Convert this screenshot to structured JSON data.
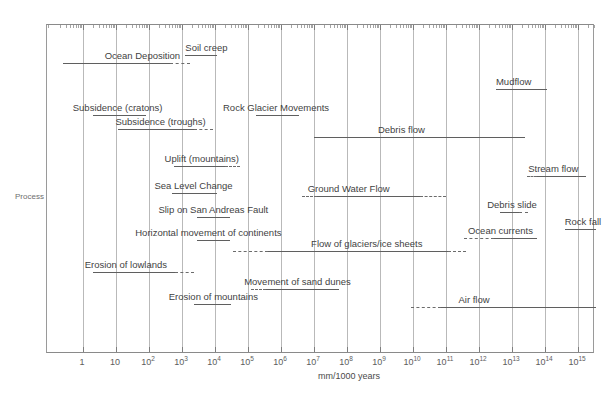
{
  "chart_data": {
    "type": "bar",
    "title": "",
    "xlabel": "mm/1000 years",
    "ylabel": "Process",
    "scale": "log10",
    "xlim": [
      -1.1,
      15.6
    ],
    "grid": true,
    "legend": "none",
    "xtick_labels": [
      "1",
      "10",
      "10²",
      "10³",
      "10⁴",
      "10⁵",
      "10⁶",
      "10⁷",
      "10⁸",
      "10⁹",
      "10¹⁰",
      "10¹¹",
      "10¹²",
      "10¹³",
      "10¹⁴",
      "10¹⁵"
    ],
    "xtick_exponents": [
      0,
      1,
      2,
      3,
      4,
      5,
      6,
      7,
      8,
      9,
      10,
      11,
      12,
      13,
      14,
      15
    ],
    "note": "Horizontal ranges of rates of geomorphic processes on a log10 axis of mm per 1000 years. Dashed segments denote uncertain / extrapolated extents of each range.",
    "series": [
      {
        "name": "Soil creep",
        "label": "Soil creep",
        "label_align": "left",
        "label_at": 3.1,
        "row_y": 54,
        "segments": [
          {
            "from": 3.1,
            "to": 4.05,
            "style": "solid"
          }
        ]
      },
      {
        "name": "Ocean Deposition",
        "label": "Ocean Deposition",
        "label_align": "center",
        "label_at": 1.8,
        "row_y": 62,
        "segments": [
          {
            "from": -0.6,
            "to": 2.65,
            "style": "solid"
          },
          {
            "from": 2.65,
            "to": 3.25,
            "style": "dashed"
          }
        ]
      },
      {
        "name": "Mudflow",
        "label": "Mudflow",
        "label_align": "center",
        "label_at": 13.05,
        "row_y": 88,
        "segments": [
          {
            "from": 12.5,
            "to": 14.05,
            "style": "solid"
          }
        ]
      },
      {
        "name": "Subsidence (cratons)",
        "label": "Subsidence (cratons)",
        "label_align": "center",
        "label_at": 1.05,
        "row_y": 114,
        "segments": [
          {
            "from": 0.3,
            "to": 1.9,
            "style": "solid"
          }
        ]
      },
      {
        "name": "Rock Glacier Movements",
        "label": "Rock Glacier Movements",
        "label_align": "center",
        "label_at": 5.85,
        "row_y": 114,
        "segments": [
          {
            "from": 5.25,
            "to": 6.55,
            "style": "solid"
          }
        ]
      },
      {
        "name": "Subsidence (troughs)",
        "label": "Subsidence (troughs)",
        "label_align": "center",
        "label_at": 2.35,
        "row_y": 128,
        "segments": [
          {
            "from": 1.05,
            "to": 3.35,
            "style": "solid"
          },
          {
            "from": 3.35,
            "to": 3.95,
            "style": "dashed"
          }
        ]
      },
      {
        "name": "Debris flow",
        "label": "Debris flow",
        "label_align": "center",
        "label_at": 9.65,
        "row_y": 136,
        "segments": [
          {
            "from": 7.0,
            "to": 13.4,
            "style": "solid"
          }
        ]
      },
      {
        "name": "Uplift (mountains)",
        "label": "Uplift (mountains)",
        "label_align": "center",
        "label_at": 3.6,
        "row_y": 165,
        "segments": [
          {
            "from": 2.75,
            "to": 4.3,
            "style": "solid"
          },
          {
            "from": 4.3,
            "to": 4.75,
            "style": "dashed"
          }
        ]
      },
      {
        "name": "Stream flow",
        "label": "Stream flow",
        "label_align": "center",
        "label_at": 14.25,
        "row_y": 175,
        "segments": [
          {
            "from": 13.45,
            "to": 13.75,
            "style": "dashed"
          },
          {
            "from": 13.75,
            "to": 15.25,
            "style": "solid"
          }
        ]
      },
      {
        "name": "Sea Level Change",
        "label": "Sea Level Change",
        "label_align": "center",
        "label_at": 3.35,
        "row_y": 192,
        "segments": [
          {
            "from": 2.7,
            "to": 4.05,
            "style": "solid"
          }
        ]
      },
      {
        "name": "Ground Water Flow",
        "label": "Ground Water Flow",
        "label_align": "center",
        "label_at": 8.05,
        "row_y": 195,
        "segments": [
          {
            "from": 6.65,
            "to": 7.1,
            "style": "dashed"
          },
          {
            "from": 7.1,
            "to": 10.2,
            "style": "solid"
          },
          {
            "from": 10.2,
            "to": 11.0,
            "style": "dashed"
          }
        ]
      },
      {
        "name": "Debris slide",
        "label": "Debris slide",
        "label_align": "center",
        "label_at": 13.0,
        "row_y": 211,
        "segments": [
          {
            "from": 12.65,
            "to": 13.2,
            "style": "solid"
          },
          {
            "from": 13.2,
            "to": 13.5,
            "style": "dashed"
          }
        ]
      },
      {
        "name": "Slip on San Andreas Fault",
        "label": "Slip on San Andreas Fault",
        "label_align": "center",
        "label_at": 3.95,
        "row_y": 216,
        "segments": [
          {
            "from": 3.45,
            "to": 4.45,
            "style": "solid"
          }
        ]
      },
      {
        "name": "Rock fall",
        "label": "Rock fall",
        "label_align": "center",
        "label_at": 15.15,
        "row_y": 228,
        "segments": [
          {
            "from": 14.6,
            "to": 15.55,
            "style": "solid"
          }
        ]
      },
      {
        "name": "Horizontal movement of continents",
        "label": "Horizontal movement of continents",
        "label_align": "center",
        "label_at": 3.8,
        "row_y": 239,
        "segments": [
          {
            "from": 3.45,
            "to": 4.45,
            "style": "solid"
          }
        ]
      },
      {
        "name": "Ocean currents",
        "label": "Ocean currents",
        "label_align": "center",
        "label_at": 12.65,
        "row_y": 237,
        "segments": [
          {
            "from": 11.55,
            "to": 12.45,
            "style": "dashed"
          },
          {
            "from": 12.45,
            "to": 13.75,
            "style": "solid"
          }
        ]
      },
      {
        "name": "Flow of glaciers/ice sheets",
        "label": "Flow of glaciers/ice sheets",
        "label_align": "center",
        "label_at": 8.6,
        "row_y": 250,
        "segments": [
          {
            "from": 4.55,
            "to": 5.6,
            "style": "dashed"
          },
          {
            "from": 5.6,
            "to": 11.05,
            "style": "solid"
          },
          {
            "from": 11.05,
            "to": 11.6,
            "style": "dashed"
          }
        ]
      },
      {
        "name": "Erosion of lowlands",
        "label": "Erosion of lowlands",
        "label_align": "center",
        "label_at": 1.3,
        "row_y": 271,
        "segments": [
          {
            "from": 0.3,
            "to": 2.8,
            "style": "solid"
          },
          {
            "from": 2.8,
            "to": 3.35,
            "style": "dashed"
          }
        ]
      },
      {
        "name": "Movement of sand dunes",
        "label": "Movement of sand dunes",
        "label_align": "center",
        "label_at": 6.5,
        "row_y": 288,
        "segments": [
          {
            "from": 5.1,
            "to": 5.55,
            "style": "dashed"
          },
          {
            "from": 5.55,
            "to": 7.75,
            "style": "solid"
          }
        ]
      },
      {
        "name": "Erosion of mountains",
        "label": "Erosion of mountains",
        "label_align": "center",
        "label_at": 3.95,
        "row_y": 303,
        "segments": [
          {
            "from": 3.35,
            "to": 4.5,
            "style": "solid"
          }
        ]
      },
      {
        "name": "Air flow",
        "label": "Air flow",
        "label_align": "center",
        "label_at": 11.85,
        "row_y": 306,
        "segments": [
          {
            "from": 9.95,
            "to": 10.85,
            "style": "dashed"
          },
          {
            "from": 10.85,
            "to": 15.55,
            "style": "solid"
          }
        ]
      }
    ]
  }
}
